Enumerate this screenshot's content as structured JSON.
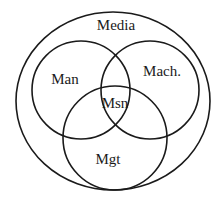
{
  "diagram": {
    "type": "venn",
    "stroke_color": "#1a1a1a",
    "background": "#ffffff",
    "outer": {
      "label": "Media",
      "shape": "ellipse"
    },
    "sets": [
      {
        "label": "Man"
      },
      {
        "label": "Mach."
      },
      {
        "label": "Mgt"
      }
    ],
    "intersection": {
      "label": "Msn"
    }
  }
}
